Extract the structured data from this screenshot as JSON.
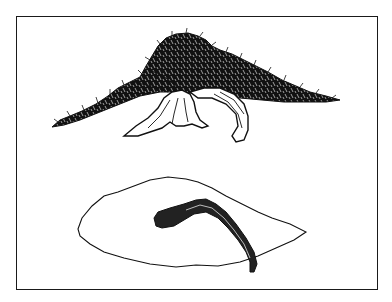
{
  "figure": {
    "description": "Bonsai illustration: side elevation of a spreading, windswept tree above; plan (top-down) view of the foliage outline and curving trunk below",
    "views": [
      {
        "name": "side-elevation",
        "label": ""
      },
      {
        "name": "plan-view",
        "label": ""
      }
    ]
  },
  "colors": {
    "ink": "#111111",
    "paper": "#ffffff",
    "frame": "#1a1a1a"
  }
}
